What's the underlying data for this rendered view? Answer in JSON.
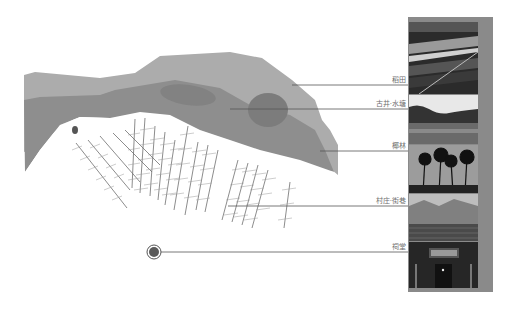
{
  "diagram": {
    "type": "village-landscape-section",
    "colors": {
      "outer_band": "#a9a9a9",
      "middle_band": "#8c8c8c",
      "pond": "#7a7a7a",
      "streets": "#777777",
      "leader_line": "#555555",
      "photo_frame": "#8a8a8a"
    }
  },
  "labels": [
    {
      "id": "paddy",
      "text": "稻田"
    },
    {
      "id": "well-pond",
      "text": "古井·水塘"
    },
    {
      "id": "coconut-grove",
      "text": "椰林"
    },
    {
      "id": "village-streets",
      "text": "村庄·街巷"
    },
    {
      "id": "ancestral-hall",
      "text": "祠堂"
    }
  ],
  "photos": [
    {
      "id": "paddy",
      "subject": "rice paddy fields"
    },
    {
      "id": "well-pond",
      "subject": "pond with trees"
    },
    {
      "id": "coconut-grove",
      "subject": "coconut palm trees"
    },
    {
      "id": "village-streets",
      "subject": "village rooftops"
    },
    {
      "id": "ancestral-hall",
      "subject": "ancestral hall gate"
    }
  ]
}
